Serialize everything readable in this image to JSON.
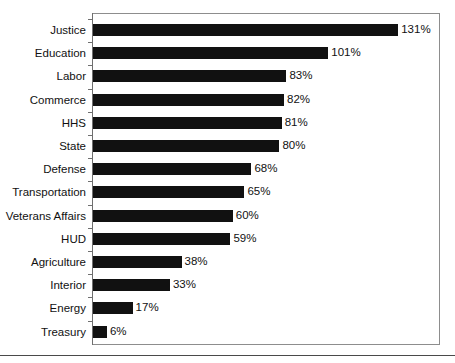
{
  "chart_data": {
    "type": "bar",
    "orientation": "horizontal",
    "title": "",
    "xlabel": "",
    "ylabel": "",
    "grid": false,
    "legend": null,
    "value_suffix": "%",
    "xlim": [
      0,
      150
    ],
    "categories": [
      "Justice",
      "Education",
      "Labor",
      "Commerce",
      "HHS",
      "State",
      "Defense",
      "Transportation",
      "Veterans Affairs",
      "HUD",
      "Agriculture",
      "Interior",
      "Energy",
      "Treasury"
    ],
    "values": [
      131,
      101,
      83,
      82,
      81,
      80,
      68,
      65,
      60,
      59,
      38,
      33,
      17,
      6
    ],
    "value_labels": [
      "131%",
      "101%",
      "83%",
      "82%",
      "81%",
      "80%",
      "68%",
      "65%",
      "60%",
      "59%",
      "38%",
      "33%",
      "17%",
      "6%"
    ],
    "bar_color": "#111111",
    "frame_color": "#8d8d8d"
  },
  "chart": {
    "title_fragment": ""
  }
}
